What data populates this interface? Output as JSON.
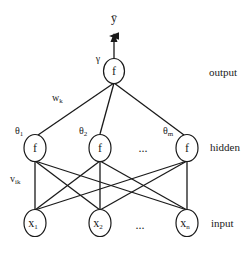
{
  "diagram": {
    "type": "neural-network",
    "output_symbol": "ȳ",
    "output_weight": "γ",
    "hidden_to_output_weight": {
      "base": "w",
      "sub": "k"
    },
    "input_to_hidden_weight": {
      "base": "v",
      "sub": "ik"
    },
    "ellipsis": "...",
    "layers": {
      "output": {
        "label": "output",
        "nodes": [
          {
            "base": "f",
            "sub": ""
          }
        ]
      },
      "hidden": {
        "label": "hidden",
        "nodes": [
          {
            "base": "f",
            "sub": "",
            "bias": {
              "base": "θ",
              "sub": "1"
            }
          },
          {
            "base": "f",
            "sub": "",
            "bias": {
              "base": "θ",
              "sub": "2"
            }
          },
          {
            "base": "f",
            "sub": "",
            "bias": {
              "base": "θ",
              "sub": "m"
            }
          }
        ]
      },
      "input": {
        "label": "input",
        "nodes": [
          {
            "base": "x",
            "sub": "1"
          },
          {
            "base": "x",
            "sub": "2"
          },
          {
            "base": "x",
            "sub": "n"
          }
        ]
      }
    },
    "colors": {
      "stroke": "#1a1a1a",
      "background": "#ffffff"
    }
  }
}
